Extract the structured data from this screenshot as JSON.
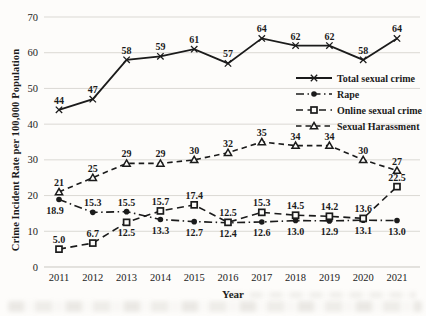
{
  "figure": {
    "background": "#fdfcfa",
    "grid_color": "#dbd9d4",
    "axis_line_color": "#c9c7c1",
    "ink_color": "#1b1b1b"
  },
  "chart_data": {
    "type": "line",
    "title": "",
    "xlabel": "Year",
    "ylabel": "Crime Incident Rate per 100,000 Population",
    "categories": [
      "2011",
      "2012",
      "2013",
      "2014",
      "2015",
      "2016",
      "2017",
      "2018",
      "2019",
      "2020",
      "2021"
    ],
    "ylim": [
      0,
      70
    ],
    "yticks": [
      0,
      10,
      20,
      30,
      40,
      50,
      60,
      70
    ],
    "grid": "horizontal",
    "legend_position": "middle-right",
    "data_labels_shown": true,
    "series": [
      {
        "name": "Total sexual crime",
        "marker": "x-cross",
        "line_style": "solid",
        "values": [
          44,
          47,
          58,
          59,
          61,
          57,
          64,
          62,
          62,
          58,
          64
        ],
        "labels": [
          "44",
          "47",
          "58",
          "59",
          "61",
          "57",
          "64",
          "62",
          "62",
          "58",
          "64"
        ],
        "label_positions": [
          "above",
          "above",
          "above",
          "above",
          "above",
          "above",
          "above",
          "above",
          "above",
          "above",
          "above"
        ]
      },
      {
        "name": "Rape",
        "marker": "circle-filled",
        "line_style": "dash-dot",
        "values": [
          18.9,
          15.3,
          15.5,
          13.3,
          12.7,
          12.4,
          12.6,
          13.0,
          12.9,
          13.1,
          13.0
        ],
        "labels": [
          "18.9",
          "15.3",
          "15.5",
          "13.3",
          "12.7",
          "12.4",
          "12.6",
          "13.0",
          "12.9",
          "13.1",
          "13.0"
        ],
        "label_positions": [
          "below-left",
          "above",
          "above",
          "below",
          "below",
          "below",
          "below",
          "below",
          "below",
          "below",
          "below"
        ]
      },
      {
        "name": "Online sexual crime",
        "marker": "square-open",
        "line_style": "dashed",
        "values": [
          5.0,
          6.7,
          12.5,
          15.7,
          17.4,
          12.5,
          15.3,
          14.5,
          14.2,
          13.6,
          22.5
        ],
        "labels": [
          "5.0",
          "6.7",
          "12.5",
          "15.7",
          "17.4",
          "12.5",
          "15.3",
          "14.5",
          "14.2",
          "13.6",
          "22.5"
        ],
        "label_positions": [
          "above",
          "above",
          "below",
          "above",
          "above",
          "above",
          "above",
          "above",
          "above",
          "above",
          "above"
        ]
      },
      {
        "name": "Sexual Harassment",
        "marker": "triangle-open",
        "line_style": "dashed-short",
        "values": [
          21,
          25,
          29,
          29,
          30,
          32,
          35,
          34,
          34,
          30,
          27
        ],
        "labels": [
          "21",
          "25",
          "29",
          "29",
          "30",
          "32",
          "35",
          "34",
          "34",
          "30",
          "27"
        ],
        "label_positions": [
          "above",
          "above",
          "above",
          "above",
          "above",
          "above",
          "above",
          "above",
          "above",
          "above",
          "above"
        ]
      }
    ]
  }
}
